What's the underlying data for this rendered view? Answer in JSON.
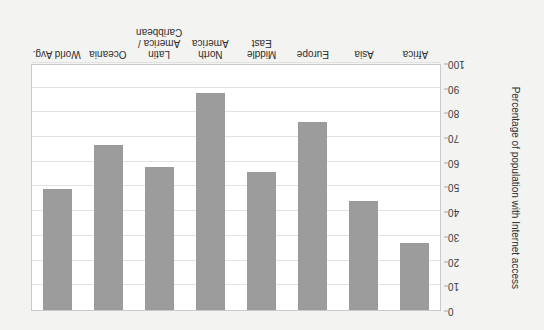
{
  "chart_data": {
    "type": "bar",
    "title": "",
    "subtitle": "",
    "xlabel": "",
    "ylabel": "Percentage of population with Internet access",
    "categories": [
      "Africa",
      "Asia",
      "Europe",
      "Middle East",
      "North America",
      "Latin America / Caribbean",
      "Oceania",
      "World Avg."
    ],
    "values": [
      27,
      44,
      76,
      56,
      88,
      58,
      67,
      49
    ],
    "ylim": [
      0,
      100
    ],
    "y_ticks": [
      0,
      10,
      20,
      30,
      40,
      50,
      60,
      70,
      80,
      90,
      100
    ],
    "y_tick_labels": [
      "0",
      "10",
      "20",
      "30",
      "40",
      "50",
      "60",
      "70",
      "80",
      "90",
      "100"
    ],
    "grid": true,
    "legend": "none",
    "orientation": "rotated-180",
    "bar_color": "#9c9c9c",
    "plot_bg": "#ffffff",
    "figure_bg": "#f3f3f1"
  },
  "figure": {
    "rotation_note": "180"
  }
}
